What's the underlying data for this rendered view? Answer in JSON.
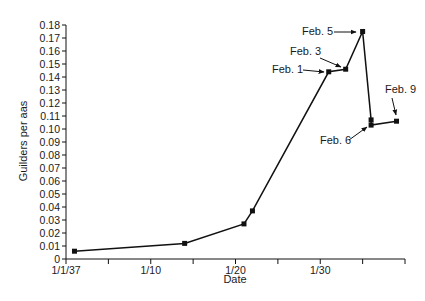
{
  "chart_data": {
    "type": "line",
    "title": "",
    "xlabel": "Date",
    "ylabel": "Guilders per aas",
    "ylim": [
      0,
      0.18
    ],
    "y_ticks": [
      "0",
      "0.01",
      "0.02",
      "0.03",
      "0.04",
      "0.05",
      "0.06",
      "0.07",
      "0.08",
      "0.09",
      "0.10",
      "0.11",
      "0.12",
      "0.13",
      "0.14",
      "0.15",
      "0.16",
      "0.17",
      "0.18"
    ],
    "x_tick_labels": [
      {
        "day": 0,
        "label": "1/1/37"
      },
      {
        "day": 10,
        "label": "1/10"
      },
      {
        "day": 20,
        "label": "1/20"
      },
      {
        "day": 30,
        "label": "1/30"
      }
    ],
    "x_tick_days": [
      0,
      5,
      10,
      15,
      20,
      25,
      30,
      35,
      40
    ],
    "xlim_days": [
      0,
      40
    ],
    "grid": false,
    "legend": null,
    "series": [
      {
        "name": "Tulip bulb price",
        "points": [
          {
            "date": "1/2",
            "day": 1,
            "value": 0.006
          },
          {
            "date": "1/15",
            "day": 14,
            "value": 0.012
          },
          {
            "date": "1/21",
            "day": 21,
            "value": 0.027
          },
          {
            "date": "1/22",
            "day": 22,
            "value": 0.037
          },
          {
            "date": "Feb. 1",
            "day": 31,
            "value": 0.144
          },
          {
            "date": "Feb. 3",
            "day": 33,
            "value": 0.146
          },
          {
            "date": "Feb. 5",
            "day": 35,
            "value": 0.175
          },
          {
            "date": "Feb. 6",
            "day": 36,
            "value": 0.107
          },
          {
            "date": "Feb. 6",
            "day": 36,
            "value": 0.103
          },
          {
            "date": "Feb. 9",
            "day": 39,
            "value": 0.106
          }
        ]
      }
    ],
    "annotations": [
      {
        "text": "Feb. 1",
        "point_index": 4
      },
      {
        "text": "Feb. 3",
        "point_index": 5
      },
      {
        "text": "Feb. 5",
        "point_index": 6
      },
      {
        "text": "Feb. 6",
        "point_index": 8
      },
      {
        "text": "Feb. 9",
        "point_index": 9
      }
    ]
  },
  "colors": {
    "line": "#111111",
    "text": "#1a1a1a",
    "background": "#ffffff"
  }
}
